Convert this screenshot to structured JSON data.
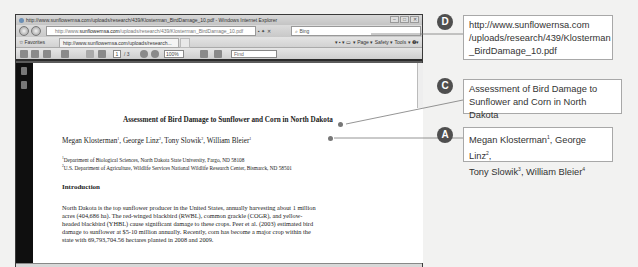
{
  "browser": {
    "window_title": "http://www.sunflowernsa.com/uploads/research/439/Klosterman_BirdDamage_10.pdf - Windows Internet Explorer",
    "window_controls": [
      "–",
      "□",
      "✕"
    ],
    "address_prefix": "http://www.",
    "address_domain": "sunflowernsa.com",
    "address_path": "/uploads/research/439/Klosterman_BirdDamage_10.pdf",
    "address_tools": "▪ ✦ ✕",
    "search_placeholder": "Bing",
    "favorites_label": "☆ Favorites",
    "tab_label": "http://www.sunflowernsa.com/uploads/research...",
    "command_bar": "▾ ▪ ▾ ▭ ▾ Page ▾  Safety ▾  Tools ▾  ❷▾"
  },
  "pdf_toolbar": {
    "current_page": "1",
    "total_pages": "/ 3",
    "zoom": "100%",
    "find_placeholder": "Find"
  },
  "document": {
    "title": "Assessment of Bird Damage to Sunflower and Corn in North Dakota",
    "authors": [
      {
        "name": "Megan Klosterman",
        "sup": "1"
      },
      {
        "name": "George Linz",
        "sup": "2"
      },
      {
        "name": "Tony Slowik",
        "sup": "2"
      },
      {
        "name": "William Bleier",
        "sup": "1"
      }
    ],
    "affiliations": [
      {
        "sup": "1",
        "text": "Department of Biological Sciences, North Dakota State University, Fargo, ND 58108"
      },
      {
        "sup": "2",
        "text": "U.S. Department of Agriculture, Wildlife Services National Wildlife Research Center, Bismarck, ND 58501"
      }
    ],
    "section_heading": "Introduction",
    "body": "North Dakota is the top sunflower producer in the United States, annually harvesting about 1 million acres (404,686 ha). The red-winged blackbird (RWBL), common grackle (COGR), and yellow-headed blackbird (YHBL) cause significant damage to these crops. Peer et al. (2003) estimated bird damage to sunflower at $5-10 million annually. Recently, corn has become a major crop within the state with 69,793,704.56 hectares planted in 2008 and 2009."
  },
  "callouts": {
    "D": {
      "badge": "D",
      "lines": [
        "http://www.sunflowernsa.com",
        "/uploads/research/439/Klosterman",
        "_BirdDamage_10.pdf"
      ]
    },
    "C": {
      "badge": "C",
      "lines": [
        "Assessment of Bird Damage to",
        "Sunflower and Corn in North Dakota"
      ]
    },
    "A": {
      "badge": "A",
      "line1_parts": [
        {
          "text": "Megan Klosterman",
          "sup": "1"
        },
        {
          "text": ", George Linz",
          "sup": "2"
        },
        {
          "text": ","
        }
      ],
      "line2_parts": [
        {
          "text": "Tony Slowik",
          "sup": "3"
        },
        {
          "text": ", William Bleier",
          "sup": "4"
        }
      ]
    }
  },
  "colors": {
    "badge": "#4f4f4f",
    "callout_border": "#a8a8a8",
    "leader_line": "#7a7a7a",
    "pdf_sidebar": "#0f0f0f"
  }
}
